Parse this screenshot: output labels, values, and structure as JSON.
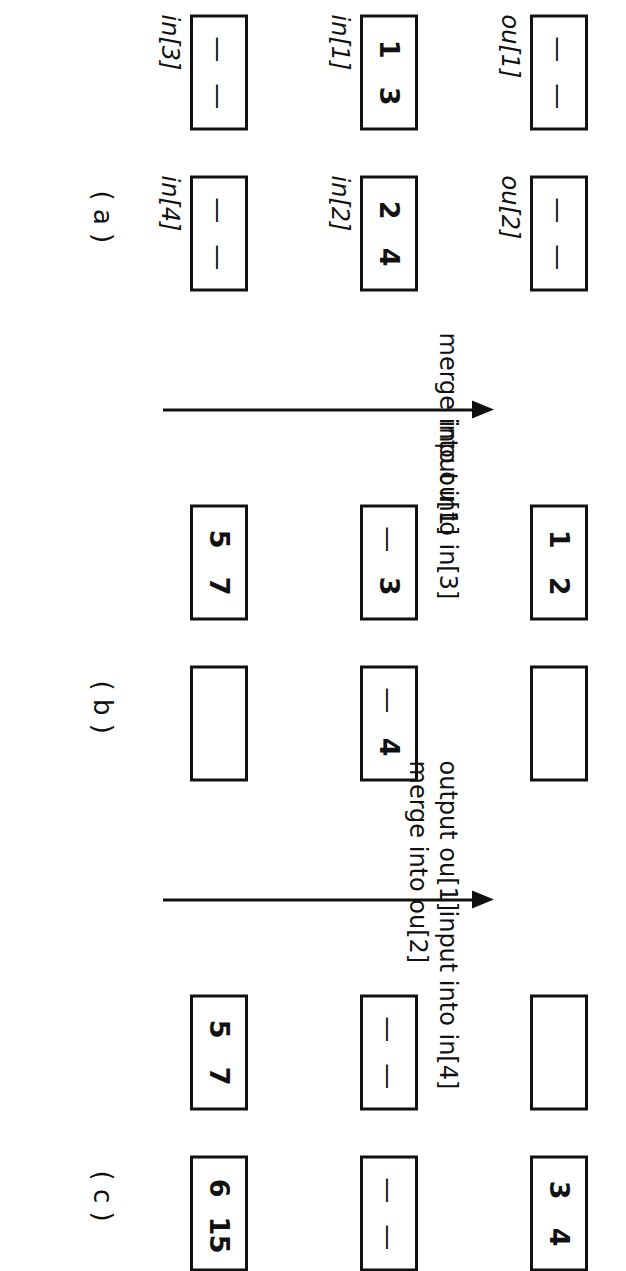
{
  "figure": {
    "orientation_note": "rotated-90-cw",
    "ink_color": "#111111",
    "page_color": "#ffffff"
  },
  "panels": [
    {
      "id": "a",
      "caption": "( a )",
      "boxes": [
        {
          "label": "ou[1]",
          "name": "ou1",
          "values": [
            "—",
            "—"
          ],
          "empty": false
        },
        {
          "label": "ou[2]",
          "name": "ou2",
          "values": [
            "—",
            "—"
          ],
          "empty": false
        },
        {
          "label": "in[1]",
          "name": "in1",
          "values": [
            "1",
            "3"
          ],
          "empty": false
        },
        {
          "label": "in[2]",
          "name": "in2",
          "values": [
            "2",
            "4"
          ],
          "empty": false
        },
        {
          "label": "in[3]",
          "name": "in3",
          "values": [
            "—",
            "—"
          ],
          "empty": false
        },
        {
          "label": "in[4]",
          "name": "in4",
          "values": [
            "—",
            "—"
          ],
          "empty": false
        }
      ]
    },
    {
      "id": "b",
      "caption": "( b )",
      "boxes": [
        {
          "label": "",
          "name": "ou1",
          "values": [
            "1",
            "2"
          ],
          "empty": false
        },
        {
          "label": "",
          "name": "ou2",
          "values": [
            "",
            ""
          ],
          "empty": true
        },
        {
          "label": "",
          "name": "in1",
          "values": [
            "—",
            "3"
          ],
          "empty": false
        },
        {
          "label": "",
          "name": "in2",
          "values": [
            "—",
            "4"
          ],
          "empty": false
        },
        {
          "label": "",
          "name": "in3",
          "values": [
            "5",
            "7"
          ],
          "empty": false
        },
        {
          "label": "",
          "name": "in4",
          "values": [
            "",
            ""
          ],
          "empty": true
        }
      ]
    },
    {
      "id": "c",
      "caption": "( c )",
      "boxes": [
        {
          "label": "",
          "name": "ou1",
          "values": [
            "",
            ""
          ],
          "empty": true
        },
        {
          "label": "",
          "name": "ou2",
          "values": [
            "3",
            "4"
          ],
          "empty": false
        },
        {
          "label": "",
          "name": "in1",
          "values": [
            "—",
            "—"
          ],
          "empty": false
        },
        {
          "label": "",
          "name": "in2",
          "values": [
            "—",
            "—"
          ],
          "empty": false
        },
        {
          "label": "",
          "name": "in3",
          "values": [
            "5",
            "7"
          ],
          "empty": false
        },
        {
          "label": "",
          "name": "in4",
          "values": [
            "6",
            "15"
          ],
          "empty": false
        }
      ]
    }
  ],
  "transitions": [
    {
      "id": "ab",
      "above_lines": [
        "merge into ou[1]"
      ],
      "below_lines": [
        "input into in[3]"
      ]
    },
    {
      "id": "bc",
      "above_lines": [
        "output ou[1]",
        "merge into ou[2]"
      ],
      "below_lines": [
        "input into in[4]"
      ]
    }
  ]
}
